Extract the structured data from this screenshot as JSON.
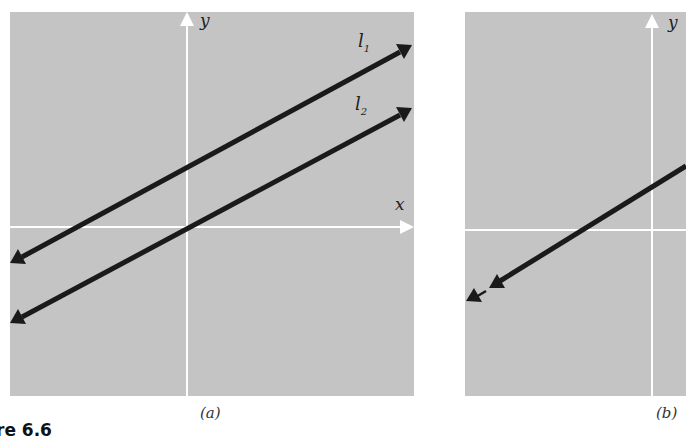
{
  "figure": {
    "label": "re 6.6",
    "panels": [
      {
        "id": "a",
        "caption": "(a)",
        "axes": {
          "x_label": "x",
          "y_label": "y"
        },
        "lines": [
          {
            "name": "l1",
            "label_main": "l",
            "label_sub": "1"
          },
          {
            "name": "l2",
            "label_main": "l",
            "label_sub": "2"
          }
        ]
      },
      {
        "id": "b",
        "caption": "(b)",
        "axes": {
          "y_label": "y"
        }
      }
    ]
  },
  "colors": {
    "panel_bg": "#c4c4c4",
    "axis": "#ffffff",
    "line": "#1a1a1a"
  }
}
